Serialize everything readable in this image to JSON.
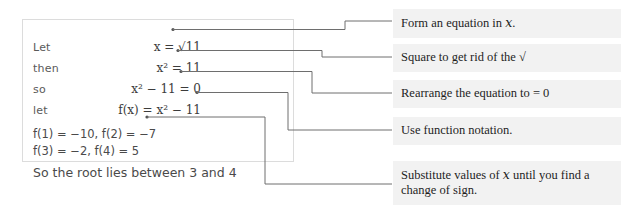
{
  "work_box": {
    "rows": [
      {
        "keyword": "Let",
        "expression": "x = √11"
      },
      {
        "keyword": "then",
        "expression": "x² = 11"
      },
      {
        "keyword": "so",
        "expression": "x² − 11 = 0"
      },
      {
        "keyword": "let",
        "expression": "f(x) = x² − 11"
      }
    ],
    "evaluations": [
      "f(1) = −10, f(2) = −7",
      "f(3) = −2, f(4) = 5"
    ],
    "conclusion": "So the root lies between 3 and 4"
  },
  "annotations": [
    {
      "text": "Form an equation in ",
      "italic": "x",
      "tail": "."
    },
    {
      "text": "Square to get rid of the ",
      "italic": "",
      "tail": "√"
    },
    {
      "text": "Rearrange the equation to = 0",
      "italic": "",
      "tail": ""
    },
    {
      "text": "Use function notation.",
      "italic": "",
      "tail": ""
    },
    {
      "text": "Substitute values of ",
      "italic": "x",
      "tail": " until you find a change of sign."
    }
  ],
  "colors": {
    "callout_background": "#f2f2f2",
    "connector_line": "#6e6e6e",
    "box_border": "#dcdcdc",
    "work_text": "#4a4a4a",
    "annotation_text": "#1e1e1e",
    "page_background": "#ffffff"
  }
}
